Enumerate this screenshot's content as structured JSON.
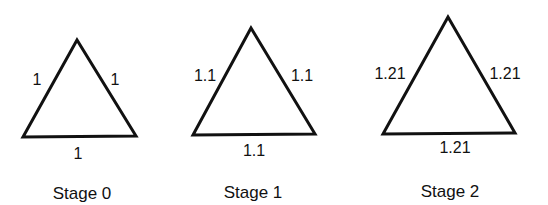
{
  "stages": [
    {
      "title": "Stage 0",
      "sides": {
        "left": "1",
        "right": "1",
        "bottom": "1"
      },
      "vertices": {
        "apex": [
          77,
          40
        ],
        "bottom_left": [
          23,
          137
        ],
        "bottom_right": [
          136,
          136
        ]
      }
    },
    {
      "title": "Stage 1",
      "sides": {
        "left": "1.1",
        "right": "1.1",
        "bottom": "1.1"
      },
      "vertices": {
        "apex": [
          251,
          28
        ],
        "bottom_left": [
          193,
          135
        ],
        "bottom_right": [
          315,
          134
        ]
      }
    },
    {
      "title": "Stage 2",
      "sides": {
        "left": "1.21",
        "right": "1.21",
        "bottom": "1.21"
      },
      "vertices": {
        "apex": [
          448,
          17
        ],
        "bottom_left": [
          383,
          134
        ],
        "bottom_right": [
          515,
          133
        ]
      }
    }
  ],
  "colors": {
    "stroke": "#111111",
    "background": "#ffffff"
  }
}
